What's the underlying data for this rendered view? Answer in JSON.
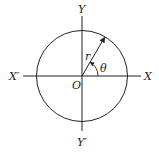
{
  "diagram": {
    "type": "polar-coordinate-circle",
    "labels": {
      "y_pos": "Y",
      "y_neg": "Y′",
      "x_pos": "X",
      "x_neg": "X′",
      "origin": "O",
      "radius": "r",
      "angle": "θ"
    },
    "geometry": {
      "center": [
        82,
        76
      ],
      "radius": 45.5,
      "radius_angle_deg": 60
    },
    "colors": {
      "stroke": "#222222",
      "background": "#ffffff"
    }
  }
}
